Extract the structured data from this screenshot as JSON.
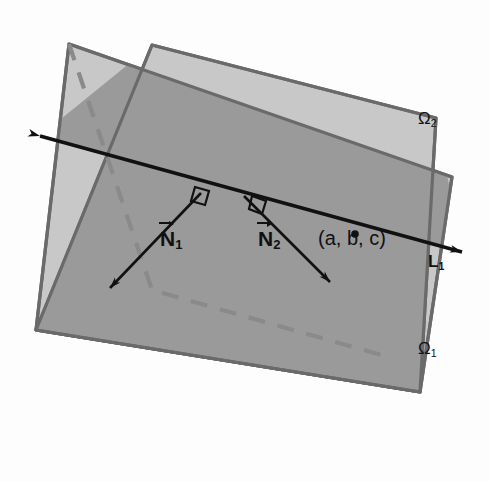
{
  "figure": {
    "type": "geometry-diagram",
    "background_color": "#fdfdfd"
  },
  "colors": {
    "plane_light": "#c8c8c8",
    "plane_overlap": "#9a9a9a",
    "plane_border": "#6a6a6a",
    "ink": "#111111",
    "dashed_line": "#8a8a8a"
  },
  "labels": {
    "plane_front": {
      "base": "Ω",
      "sub": "1",
      "name": "Omega 1"
    },
    "plane_back": {
      "base": "Ω",
      "sub": "2",
      "name": "Omega 2"
    },
    "normal_1": {
      "base": "N",
      "sub": "1",
      "name": "vector N 1"
    },
    "normal_2": {
      "base": "N",
      "sub": "2",
      "name": "vector N 2"
    },
    "point": {
      "text": "(a, b, c)",
      "name": "point a b c"
    },
    "line": {
      "base": "L",
      "sub": "1",
      "name": "line L 1"
    }
  },
  "geometry": {
    "plane_front_polygon": "152,45 436,118 420,392 36,330",
    "plane_back_polygon": "69,44 452,177 420,392 36,330",
    "intersection_line": {
      "x1": 40,
      "y1": 136,
      "x2": 462,
      "y2": 252
    },
    "point_marker": {
      "cx": 355,
      "cy": 234,
      "r": 3.6
    },
    "normal_1_vector": {
      "x1": 201,
      "y1": 193,
      "x2": 108,
      "y2": 290
    },
    "normal_2_vector": {
      "x1": 244,
      "y1": 196,
      "x2": 330,
      "y2": 281
    },
    "hidden_edge_dashed": "69,44 152,290 392,358"
  }
}
